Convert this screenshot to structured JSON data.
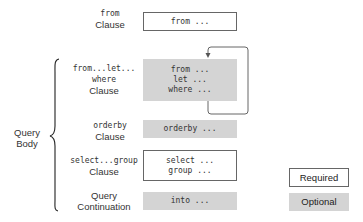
{
  "diagram": {
    "type": "query expression structure",
    "rows": [
      {
        "label_code": "from",
        "label_text": "Clause",
        "box_lines": [
          "from ..."
        ],
        "kind": "required"
      },
      {
        "label_code": "from...let...\nwhere",
        "label_code_lines": [
          "from...let...",
          "where"
        ],
        "label_text": "Clause",
        "box_lines": [
          "from ...",
          "let ...",
          "where ..."
        ],
        "kind": "optional",
        "repeatable": true
      },
      {
        "label_code": "orderby",
        "label_text": "Clause",
        "box_lines": [
          "orderby ..."
        ],
        "kind": "optional"
      },
      {
        "label_code": "select...group",
        "label_text": "Clause",
        "box_lines": [
          "select ...",
          "group ..."
        ],
        "kind": "required"
      },
      {
        "label_text_lines": [
          "Query",
          "Continuation"
        ],
        "box_lines": [
          "into ..."
        ],
        "kind": "optional"
      }
    ],
    "group_label": [
      "Query",
      "Body"
    ],
    "legend": [
      {
        "label": "Required",
        "color": "#ffffff",
        "border": "#666666"
      },
      {
        "label": "Optional",
        "color": "#d4d4d4"
      }
    ],
    "colors": {
      "optional_fill": "#d4d4d4",
      "required_border": "#666666",
      "line": "#555555"
    }
  }
}
